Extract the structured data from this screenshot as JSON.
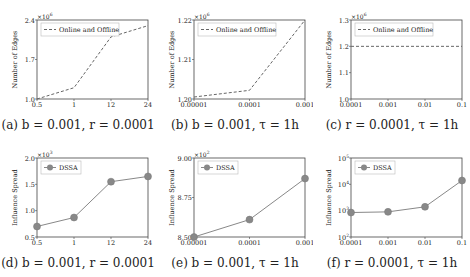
{
  "chart_data": [
    {
      "id": "a",
      "type": "line",
      "title": "",
      "caption": "(a) b = 0.001, r = 0.0001",
      "xlabel": "τ (h)",
      "ylabel": "Number of Edges",
      "y_multiplier": "×10^6",
      "categories": [
        "0.5",
        "1",
        "12",
        "24"
      ],
      "yticks": [
        "1.0",
        "1.7",
        "2.4"
      ],
      "ylim": [
        1.0,
        2.4
      ],
      "series": [
        {
          "name": "Online and Offline",
          "style": "dashed",
          "values": [
            1.0,
            1.2,
            2.1,
            2.3
          ]
        }
      ],
      "legend": "upper left",
      "grid": false
    },
    {
      "id": "b",
      "type": "line",
      "caption": "(b) b = 0.001, τ = 1h",
      "xlabel": "r",
      "ylabel": "Number of Edges",
      "y_multiplier": "×10^6",
      "categories": [
        "0.00001",
        "0.0001",
        "0.001"
      ],
      "yticks": [
        "1.20",
        "1.21",
        "1.22"
      ],
      "ylim": [
        1.2,
        1.22
      ],
      "series": [
        {
          "name": "Online and Offline",
          "style": "dashed",
          "values": [
            1.2005,
            1.2022,
            1.22
          ]
        }
      ],
      "legend": "upper left",
      "grid": false
    },
    {
      "id": "c",
      "type": "line",
      "caption": "(c) r = 0.0001, τ = 1h",
      "xlabel": "b",
      "ylabel": "Number of Edges",
      "y_multiplier": "×10^6",
      "categories": [
        "0.0001",
        "0.001",
        "0.01",
        "0.1"
      ],
      "yticks": [
        "1.0",
        "1.1",
        "1.2",
        "1.3"
      ],
      "ylim": [
        1.0,
        1.3
      ],
      "series": [
        {
          "name": "Online and Offline",
          "style": "dashed",
          "values": [
            1.2,
            1.2,
            1.2,
            1.2
          ]
        }
      ],
      "legend": "upper left",
      "grid": false
    },
    {
      "id": "d",
      "type": "line",
      "caption": "(d) b = 0.001, r = 0.0001",
      "xlabel": "τ (h)",
      "ylabel": "Influence Spread",
      "y_multiplier": "×10^3",
      "categories": [
        "0.5",
        "1",
        "12",
        "24"
      ],
      "yticks": [
        "0.5",
        "1.0",
        "1.5",
        "2.0"
      ],
      "ylim": [
        0.5,
        2.0
      ],
      "series": [
        {
          "name": "DSSA",
          "style": "solid-marker",
          "values": [
            0.7,
            0.87,
            1.55,
            1.65
          ]
        }
      ],
      "legend": "upper left",
      "grid": false
    },
    {
      "id": "e",
      "type": "line",
      "caption": "(e) b = 0.001, τ = 1h",
      "xlabel": "r",
      "ylabel": "Influence Spread",
      "y_multiplier": "×10^2",
      "categories": [
        "0.00001",
        "0.0001",
        "0.001"
      ],
      "yticks": [
        "8.50",
        "8.75",
        "9.00"
      ],
      "ylim": [
        8.5,
        9.0
      ],
      "series": [
        {
          "name": "DSSA",
          "style": "solid-marker",
          "values": [
            8.5,
            8.61,
            8.87
          ]
        }
      ],
      "legend": "upper left",
      "grid": false
    },
    {
      "id": "f",
      "type": "line",
      "caption": "(f) r = 0.0001, τ = 1h",
      "xlabel": "b",
      "ylabel": "Influence Spread",
      "yscale": "log",
      "categories": [
        "0.0001",
        "0.001",
        "0.01",
        "0.1"
      ],
      "yticks": [
        "10^2",
        "10^3",
        "10^4",
        "10^5"
      ],
      "ylim": [
        100,
        100000
      ],
      "series": [
        {
          "name": "DSSA",
          "style": "solid-marker",
          "values": [
            850,
            900,
            1400,
            14000
          ]
        }
      ],
      "legend": "upper left",
      "grid": false
    }
  ]
}
